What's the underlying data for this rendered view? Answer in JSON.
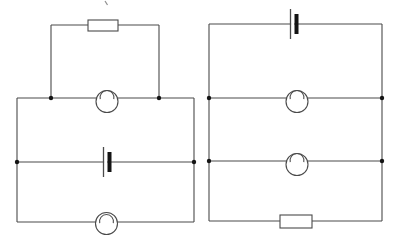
{
  "page": {
    "background": "#ffffff"
  },
  "figure": {
    "width": 393,
    "height": 241,
    "line_color": "#4a4a4a",
    "dot_color": "#141414",
    "component_fill": "#ffffff",
    "stray_mark": {
      "x1": 105,
      "y1": 1,
      "x2": 107.5,
      "y2": 5,
      "color": "#8f8f8f"
    },
    "circuits": [
      {
        "id": "left-circuit",
        "description": "parallel circuit: cell on middle rail, lamp on junction rail with resistor loop above, lamp on bottom rail",
        "wires": [
          [
            [
              17,
              98
            ],
            [
              194,
              98
            ]
          ],
          [
            [
              194,
              98
            ],
            [
              194,
              222
            ]
          ],
          [
            [
              194,
              222
            ],
            [
              17,
              222
            ]
          ],
          [
            [
              17,
              222
            ],
            [
              17,
              98
            ]
          ],
          [
            [
              17,
              162
            ],
            [
              194,
              162
            ]
          ],
          [
            [
              51,
              98
            ],
            [
              51,
              25
            ]
          ],
          [
            [
              51,
              25
            ],
            [
              159,
              25
            ]
          ],
          [
            [
              159,
              25
            ],
            [
              159,
              98
            ]
          ]
        ],
        "dots": [
          [
            51,
            98
          ],
          [
            159,
            98
          ],
          [
            17,
            162
          ],
          [
            194,
            162
          ]
        ],
        "components": [
          {
            "type": "resistor",
            "name": "resistor",
            "cx": 103,
            "cy": 25.5,
            "w": 30,
            "h": 11
          },
          {
            "type": "lamp",
            "name": "lamp",
            "cx": 107,
            "cy": 101.5,
            "r": 11,
            "wy": 98
          },
          {
            "type": "battery",
            "name": "battery-cell",
            "cx": 107,
            "cy": 162
          },
          {
            "type": "lamp",
            "name": "lamp",
            "cx": 106.5,
            "cy": 223.5,
            "r": 11,
            "wy": 222
          }
        ]
      },
      {
        "id": "right-circuit",
        "description": "parallel circuit: cell on top rail, two lamp rails with junction dots, resistor on bottom rail",
        "wires": [
          [
            [
              209,
              24
            ],
            [
              382,
              24
            ]
          ],
          [
            [
              382,
              24
            ],
            [
              382,
              221
            ]
          ],
          [
            [
              382,
              221
            ],
            [
              209,
              221
            ]
          ],
          [
            [
              209,
              221
            ],
            [
              209,
              24
            ]
          ],
          [
            [
              209,
              98
            ],
            [
              382,
              98
            ]
          ],
          [
            [
              209,
              161
            ],
            [
              382,
              161
            ]
          ]
        ],
        "dots": [
          [
            209,
            98
          ],
          [
            382,
            98
          ],
          [
            209,
            161
          ],
          [
            382,
            161
          ]
        ],
        "components": [
          {
            "type": "battery",
            "name": "battery-cell",
            "cx": 294,
            "cy": 24
          },
          {
            "type": "lamp",
            "name": "lamp",
            "cx": 297,
            "cy": 101.5,
            "r": 11,
            "wy": 98
          },
          {
            "type": "lamp",
            "name": "lamp",
            "cx": 297,
            "cy": 164.5,
            "r": 11,
            "wy": 161
          },
          {
            "type": "resistor",
            "name": "resistor",
            "cx": 296,
            "cy": 221.5,
            "w": 32,
            "h": 13
          }
        ]
      }
    ]
  }
}
